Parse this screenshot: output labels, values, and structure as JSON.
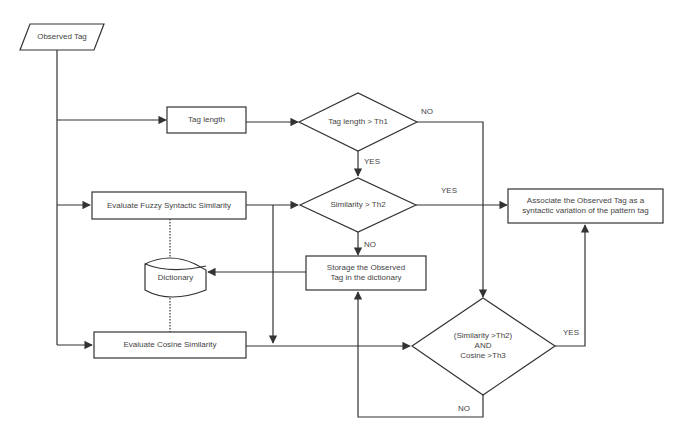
{
  "diagram": {
    "type": "flowchart",
    "nodes": {
      "observed_tag": {
        "shape": "parallelogram",
        "label": "Observed Tag"
      },
      "tag_length": {
        "shape": "process",
        "label": "Tag length"
      },
      "tag_length_decision": {
        "shape": "decision",
        "label": "Tag length > Th1"
      },
      "fuzzy_similarity": {
        "shape": "process",
        "label": "Evaluate Fuzzy Syntactic Similarity"
      },
      "similarity_decision": {
        "shape": "decision",
        "label": "Similarity > Th2"
      },
      "dictionary": {
        "shape": "database",
        "label": "Dictionary"
      },
      "storage": {
        "shape": "process",
        "line1": "Storage the Observed",
        "line2": "Tag in the dictionary"
      },
      "cosine_similarity": {
        "shape": "process",
        "label": "Evaluate Cosine Similarity"
      },
      "combined_decision": {
        "shape": "decision",
        "line1": "(Similarity >Th2)",
        "line2": "AND",
        "line3": "Cosine >Th3"
      },
      "associate": {
        "shape": "process",
        "line1": "Associate the Observed Tag as a",
        "line2": "syntactic variation of the pattern tag"
      }
    },
    "edge_labels": {
      "tag_length_no": "NO",
      "tag_length_yes": "YES",
      "similarity_yes": "YES",
      "similarity_no": "NO",
      "combined_yes": "YES",
      "combined_no": "NO"
    },
    "edges": [
      {
        "from": "observed_tag",
        "to": "tag_length"
      },
      {
        "from": "observed_tag",
        "to": "fuzzy_similarity"
      },
      {
        "from": "observed_tag",
        "to": "cosine_similarity"
      },
      {
        "from": "tag_length",
        "to": "tag_length_decision"
      },
      {
        "from": "tag_length_decision",
        "to": "similarity_decision",
        "label": "YES"
      },
      {
        "from": "tag_length_decision",
        "to": "combined_decision",
        "label": "NO"
      },
      {
        "from": "fuzzy_similarity",
        "to": "similarity_decision"
      },
      {
        "from": "fuzzy_similarity",
        "to": "cosine_similarity"
      },
      {
        "from": "similarity_decision",
        "to": "associate",
        "label": "YES"
      },
      {
        "from": "similarity_decision",
        "to": "storage",
        "label": "NO"
      },
      {
        "from": "storage",
        "to": "dictionary"
      },
      {
        "from": "dictionary",
        "to": "fuzzy_similarity",
        "style": "dotted"
      },
      {
        "from": "dictionary",
        "to": "cosine_similarity",
        "style": "dotted"
      },
      {
        "from": "cosine_similarity",
        "to": "combined_decision"
      },
      {
        "from": "combined_decision",
        "to": "associate",
        "label": "YES"
      },
      {
        "from": "combined_decision",
        "to": "storage",
        "label": "NO"
      }
    ],
    "colors": {
      "stroke": "#333333",
      "text": "#444444",
      "background": "#ffffff"
    }
  }
}
